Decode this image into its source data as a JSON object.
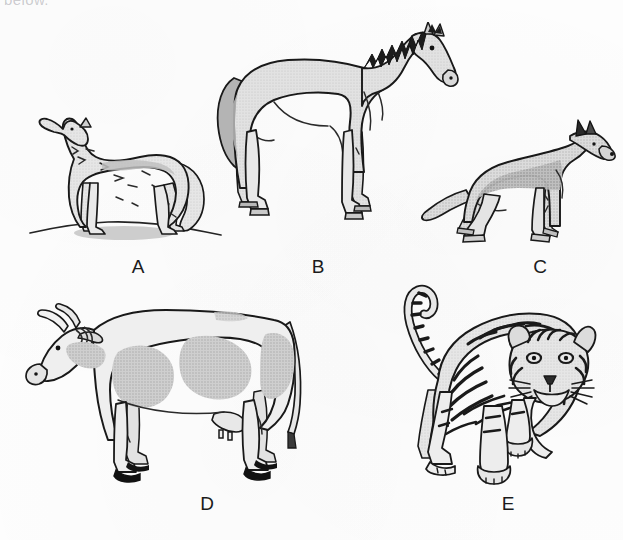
{
  "page": {
    "width": 623,
    "height": 540,
    "background_color": "#fdfdfd",
    "cut_off_header_text": "below."
  },
  "palette": {
    "ink": "#141414",
    "body_light": "#ebebeb",
    "body_mid": "#d2d2d2",
    "body_dark": "#a9a9a9",
    "spot_gray": "#c4c4c4",
    "shadow_gray": "#b9b9b9",
    "hoof_black": "#111111",
    "paper": "#fdfdfd"
  },
  "figures": [
    {
      "id": "A",
      "label": "A",
      "animal": "wolf",
      "description": "Howling wolf standing on a small rounded mound, head raised and muzzle pointed up-left, bushy tail hanging down, shaggy gray coat.",
      "facing": "left",
      "pose": "standing-howling",
      "has_ground_line": true,
      "fill_color": "#e3e3e3",
      "label_x": 138,
      "label_y": 256
    },
    {
      "id": "B",
      "label": "B",
      "animal": "horse",
      "description": "Horse standing in profile facing right, dark jagged mane along the neck, long tail, light gray body with darker shading on the hindquarters.",
      "facing": "right",
      "pose": "standing",
      "has_ground_line": false,
      "fill_color": "#dcdcdc",
      "label_x": 318,
      "label_y": 256
    },
    {
      "id": "C",
      "label": "C",
      "animal": "dog",
      "description": "German Shepherd dog in profile facing right, pointed erect ears, crouched stance, bushy lowered tail, darker gray saddle marking over the back.",
      "facing": "right",
      "pose": "standing-crouched",
      "has_ground_line": false,
      "fill_color": "#d8d8d8",
      "label_x": 540,
      "label_y": 256
    },
    {
      "id": "D",
      "label": "D",
      "animal": "cow",
      "description": "Spotted dairy cow in profile facing left, two curved horns, large gray patches on a white body, udder visible, black hooves, tail hanging at the rear.",
      "facing": "left",
      "pose": "standing",
      "has_ground_line": false,
      "fill_color": "#efefef",
      "label_x": 207,
      "label_y": 493
    },
    {
      "id": "E",
      "label": "E",
      "animal": "tiger",
      "description": "Striped tiger walking toward the viewer, head facing forward with whiskers and dark facial stripes, raised ringed tail curving up behind.",
      "facing": "front",
      "pose": "walking-forward",
      "has_ground_line": false,
      "fill_color": "#e6e6e6",
      "label_x": 508,
      "label_y": 493
    }
  ]
}
